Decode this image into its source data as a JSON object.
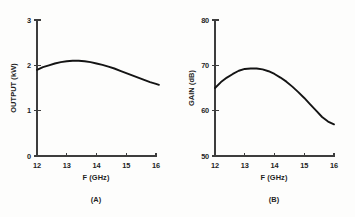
{
  "figure": {
    "background_color": "#fdfdfc",
    "curve_color": "#141414",
    "axis_color": "#3d3d3d",
    "text_color": "#1f1f1f"
  },
  "chart_data": [
    {
      "type": "line",
      "panel_id": "A",
      "caption": "(A)",
      "title": "",
      "xlabel": "F (GHz)",
      "ylabel": "OUTPUT (kW)",
      "xlim": [
        12,
        16
      ],
      "ylim": [
        0,
        3
      ],
      "xticks": [
        12,
        13,
        14,
        15,
        16
      ],
      "xticklabels": [
        "12",
        "13",
        "14",
        "15",
        "16"
      ],
      "yticks": [
        0,
        1,
        2,
        3
      ],
      "yticklabels": [
        "0",
        "1",
        "2",
        "3"
      ],
      "grid": false,
      "legend": null,
      "x": [
        12.0,
        12.2,
        12.4,
        12.6,
        12.8,
        13.0,
        13.2,
        13.4,
        13.6,
        13.8,
        14.0,
        14.2,
        14.4,
        14.6,
        14.8,
        15.0,
        15.2,
        15.4,
        15.6,
        15.8,
        16.0,
        16.1
      ],
      "values": [
        1.9,
        1.96,
        2.0,
        2.04,
        2.07,
        2.09,
        2.1,
        2.1,
        2.09,
        2.07,
        2.04,
        2.01,
        1.97,
        1.93,
        1.88,
        1.83,
        1.78,
        1.73,
        1.68,
        1.63,
        1.59,
        1.57
      ]
    },
    {
      "type": "line",
      "panel_id": "B",
      "caption": "(B)",
      "title": "",
      "xlabel": "F (GHz)",
      "ylabel": "GAIN (dB)",
      "xlim": [
        12,
        16
      ],
      "ylim": [
        50,
        80
      ],
      "xticks": [
        12,
        13,
        14,
        15,
        16
      ],
      "xticklabels": [
        "12",
        "13",
        "14",
        "15",
        "16"
      ],
      "yticks": [
        50,
        60,
        70,
        80
      ],
      "yticklabels": [
        "50",
        "60",
        "70",
        "80"
      ],
      "grid": false,
      "legend": null,
      "x": [
        12.0,
        12.2,
        12.4,
        12.6,
        12.8,
        13.0,
        13.2,
        13.4,
        13.6,
        13.8,
        14.0,
        14.2,
        14.4,
        14.6,
        14.8,
        15.0,
        15.2,
        15.4,
        15.6,
        15.8,
        16.0
      ],
      "values": [
        65.0,
        66.3,
        67.3,
        68.1,
        68.8,
        69.2,
        69.3,
        69.3,
        69.1,
        68.7,
        68.1,
        67.3,
        66.4,
        65.3,
        64.1,
        62.8,
        61.4,
        60.0,
        58.6,
        57.6,
        57.0
      ]
    }
  ]
}
